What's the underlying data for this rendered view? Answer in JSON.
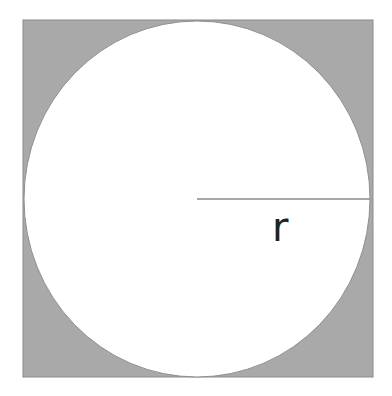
{
  "diagram": {
    "title": "",
    "shapes": {
      "square": {
        "x": 23,
        "y": 20,
        "width": 350,
        "height": 357,
        "fill": "#a9a9a9",
        "stroke": "#8a8a8a"
      },
      "circle": {
        "cx": 197,
        "cy": 199,
        "r": 173,
        "ry": 178,
        "fill": "#ffffff",
        "stroke": "#8f8f8f"
      },
      "radius_line": {
        "x1": 197,
        "y1": 199,
        "x2": 370,
        "y2": 199,
        "stroke": "#8a8a8a"
      }
    },
    "labels": {
      "radius": "r"
    }
  }
}
